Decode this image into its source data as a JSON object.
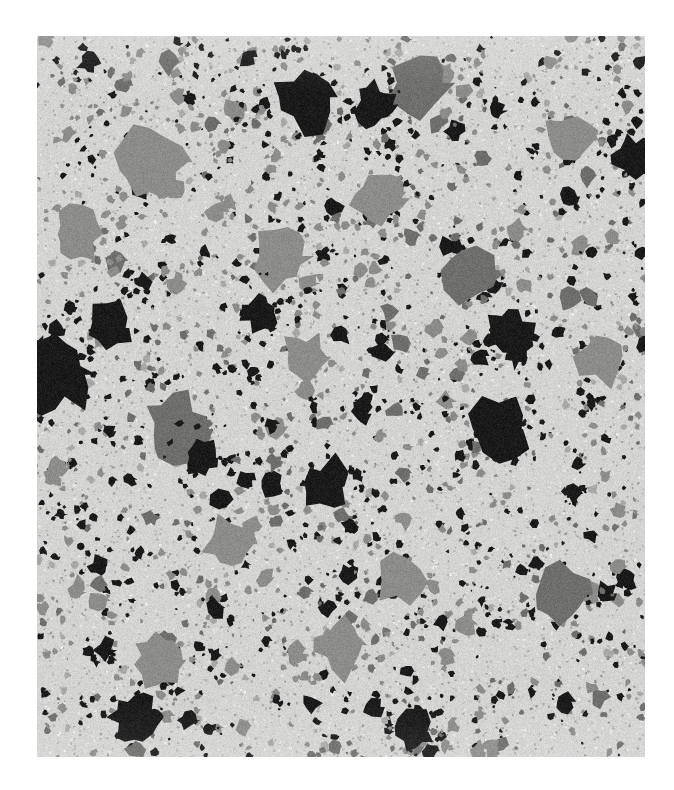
{
  "page": {
    "background_color": "#ffffff",
    "width": 674,
    "height": 790
  },
  "figure": {
    "name": "micrograph",
    "type": "grayscale-micrograph",
    "description": "Backscattered electron micrograph of a particulate composite microstructure showing dispersed dark and mid-gray second-phase particles in a light gray matrix",
    "x": 37,
    "y": 36,
    "width": 608,
    "height": 721,
    "matrix_color": "#d3d3d1",
    "matrix_noise_color": "#c4c4c2",
    "phase_colors": {
      "matrix_light_gray": "#d3d3d1",
      "particle_mid_gray": "#8c8c8a",
      "particle_dark_gray": "#6e6e6c",
      "particle_black": "#1a1a1a",
      "speckle_gray": "#a8a8a6"
    },
    "phases": [
      {
        "label": "matrix",
        "gray_level": 211,
        "area_fraction": 0.72
      },
      {
        "label": "mid-gray particles",
        "gray_level": 140,
        "area_fraction": 0.18
      },
      {
        "label": "black particles",
        "gray_level": 26,
        "area_fraction": 0.1
      }
    ],
    "texture": {
      "fine_speckle_count": 5200,
      "small_particle_count": 1400,
      "medium_particle_count": 260,
      "large_particle_count": 62,
      "random_seed": 20240517
    },
    "large_black_particles": [
      {
        "cx": 0.03,
        "cy": 0.47,
        "r": 0.035
      },
      {
        "cx": 0.44,
        "cy": 0.085,
        "r": 0.032
      },
      {
        "cx": 0.76,
        "cy": 0.545,
        "r": 0.03
      },
      {
        "cx": 0.47,
        "cy": 0.625,
        "r": 0.026
      },
      {
        "cx": 0.78,
        "cy": 0.415,
        "r": 0.024
      },
      {
        "cx": 0.16,
        "cy": 0.945,
        "r": 0.024
      },
      {
        "cx": 0.12,
        "cy": 0.405,
        "r": 0.022
      },
      {
        "cx": 0.555,
        "cy": 0.095,
        "r": 0.021
      },
      {
        "cx": 0.985,
        "cy": 0.165,
        "r": 0.022
      },
      {
        "cx": 0.62,
        "cy": 0.965,
        "r": 0.02
      },
      {
        "cx": 0.365,
        "cy": 0.385,
        "r": 0.018
      },
      {
        "cx": 0.27,
        "cy": 0.585,
        "r": 0.018
      }
    ],
    "large_gray_particles": [
      {
        "cx": 0.19,
        "cy": 0.175,
        "r": 0.034
      },
      {
        "cx": 0.63,
        "cy": 0.065,
        "r": 0.032
      },
      {
        "cx": 0.23,
        "cy": 0.545,
        "r": 0.032
      },
      {
        "cx": 0.4,
        "cy": 0.305,
        "r": 0.03
      },
      {
        "cx": 0.86,
        "cy": 0.775,
        "r": 0.03
      },
      {
        "cx": 0.56,
        "cy": 0.225,
        "r": 0.028
      },
      {
        "cx": 0.71,
        "cy": 0.325,
        "r": 0.027
      },
      {
        "cx": 0.315,
        "cy": 0.705,
        "r": 0.026
      },
      {
        "cx": 0.875,
        "cy": 0.145,
        "r": 0.026
      },
      {
        "cx": 0.5,
        "cy": 0.845,
        "r": 0.026
      },
      {
        "cx": 0.065,
        "cy": 0.275,
        "r": 0.025
      },
      {
        "cx": 0.93,
        "cy": 0.445,
        "r": 0.025
      },
      {
        "cx": 0.2,
        "cy": 0.865,
        "r": 0.024
      },
      {
        "cx": 0.6,
        "cy": 0.755,
        "r": 0.024
      },
      {
        "cx": 0.44,
        "cy": 0.445,
        "r": 0.023
      }
    ]
  }
}
